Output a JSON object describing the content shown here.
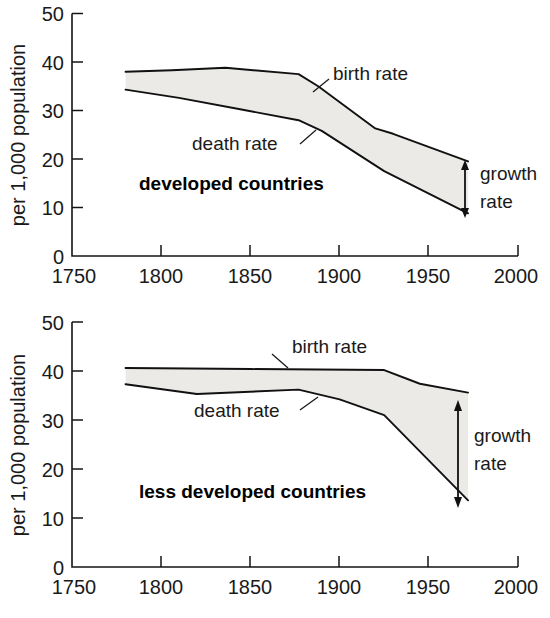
{
  "figure": {
    "background_color": "#ffffff",
    "line_color": "#111111",
    "band_fill_color": "#eceae6"
  },
  "chart_data": [
    {
      "type": "line",
      "id": "developed-countries",
      "title": "developed countries",
      "xlabel": "",
      "ylabel": "per 1,000 population",
      "xlim": [
        1750,
        2000
      ],
      "ylim": [
        0,
        50
      ],
      "grid": false,
      "legend_position": "inline-annotation",
      "xticks": [
        1750,
        1800,
        1850,
        1900,
        1950,
        2000
      ],
      "xtick_labels": [
        "1750",
        "1800",
        "1850",
        "1900",
        "1950",
        "2000"
      ],
      "yticks": [
        0,
        10,
        20,
        30,
        40,
        50
      ],
      "ytick_labels": [
        "0",
        "10",
        "20",
        "30",
        "40",
        "50"
      ],
      "series": [
        {
          "name": "birth rate",
          "x": [
            1780,
            1806,
            1836,
            1877,
            1888,
            1920,
            1930,
            1972
          ],
          "values": [
            38.0,
            38.3,
            38.8,
            37.5,
            35.0,
            26.3,
            25.2,
            19.5
          ]
        },
        {
          "name": "death rate",
          "x": [
            1780,
            1810,
            1845,
            1877,
            1890,
            1925,
            1972
          ],
          "values": [
            34.3,
            32.6,
            30.2,
            28.0,
            25.8,
            17.5,
            8.8
          ]
        }
      ],
      "annotations": [
        {
          "text": "birth rate",
          "x": 1900,
          "y": 36.5
        },
        {
          "text": "death rate",
          "x": 1815,
          "y": 24.5
        },
        {
          "text": "growth rate",
          "x": 1985,
          "y": 14.5
        },
        {
          "text": "developed countries",
          "x": 1845,
          "y": 16.0
        }
      ],
      "growth_rate_marker": {
        "x": 1972,
        "from": 8.8,
        "to": 19.5
      }
    },
    {
      "type": "line",
      "id": "less-developed-countries",
      "title": "less developed countries",
      "xlabel": "",
      "ylabel": "per 1,000 population",
      "xlim": [
        1750,
        2000
      ],
      "ylim": [
        0,
        50
      ],
      "grid": false,
      "legend_position": "inline-annotation",
      "xticks": [
        1750,
        1800,
        1850,
        1900,
        1950,
        2000
      ],
      "xtick_labels": [
        "1750",
        "1800",
        "1850",
        "1900",
        "1950",
        "2000"
      ],
      "yticks": [
        0,
        10,
        20,
        30,
        40,
        50
      ],
      "ytick_labels": [
        "0",
        "10",
        "20",
        "30",
        "40",
        "50"
      ],
      "series": [
        {
          "name": "birth rate",
          "x": [
            1780,
            1850,
            1925,
            1945,
            1972
          ],
          "values": [
            40.6,
            40.4,
            40.2,
            37.4,
            35.6
          ]
        },
        {
          "name": "death rate",
          "x": [
            1780,
            1820,
            1877,
            1900,
            1925,
            1972
          ],
          "values": [
            37.3,
            35.3,
            36.2,
            34.2,
            31.0,
            13.6
          ]
        }
      ],
      "annotations": [
        {
          "text": "birth rate",
          "x": 1890,
          "y": 43.8
        },
        {
          "text": "death rate",
          "x": 1848,
          "y": 32.2
        },
        {
          "text": "growth rate",
          "x": 1985,
          "y": 25.5
        },
        {
          "text": "less developed countries",
          "x": 1850,
          "y": 19.5
        }
      ],
      "growth_rate_marker": {
        "x": 1972,
        "from": 13.6,
        "to": 35.6
      }
    }
  ]
}
